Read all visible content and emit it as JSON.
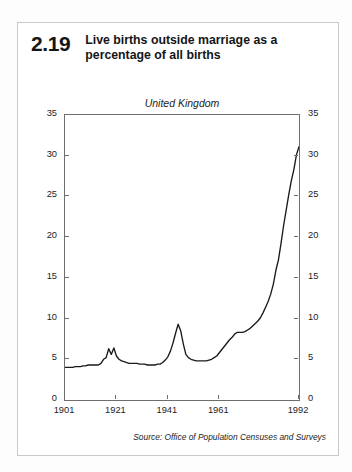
{
  "figure": {
    "number": "2.19",
    "title_line1": "Live births outside marriage as a",
    "title_line2": "percentage of all births",
    "source": "Source: Office of Population Censuses and Surveys"
  },
  "chart_data": {
    "type": "line",
    "title": "Live births outside marriage as a percentage of all births",
    "subtitle": "United Kingdom",
    "ylabel": "Percentages",
    "xlabel": "",
    "ylim": [
      0,
      35
    ],
    "xlim": [
      1901,
      1992
    ],
    "grid": false,
    "legend": "none",
    "yticks": [
      0,
      5,
      10,
      15,
      20,
      25,
      30,
      35
    ],
    "ytick_labels": [
      "0",
      "5",
      "10",
      "15",
      "20",
      "25",
      "30",
      "35"
    ],
    "ytick_labels_right": [
      "0",
      "5",
      "10",
      "15",
      "20",
      "25",
      "30",
      "35"
    ],
    "xticks": [
      1901,
      1921,
      1941,
      1961,
      1992
    ],
    "xtick_labels": [
      "1901",
      "1921",
      "1941",
      "1961",
      "1992"
    ],
    "axis_note_top": "United Kingdom",
    "axis_note_inner": "Percentages",
    "series": [
      {
        "name": "Live births outside marriage (% of all births)",
        "color": "#1a1a1a",
        "x": [
          1901,
          1902,
          1903,
          1904,
          1905,
          1906,
          1907,
          1908,
          1909,
          1910,
          1911,
          1912,
          1913,
          1914,
          1915,
          1916,
          1917,
          1918,
          1919,
          1920,
          1921,
          1922,
          1923,
          1924,
          1925,
          1926,
          1927,
          1928,
          1929,
          1930,
          1931,
          1932,
          1933,
          1934,
          1935,
          1936,
          1937,
          1938,
          1939,
          1940,
          1941,
          1942,
          1943,
          1944,
          1945,
          1946,
          1947,
          1948,
          1949,
          1950,
          1951,
          1952,
          1953,
          1954,
          1955,
          1956,
          1957,
          1958,
          1959,
          1960,
          1961,
          1962,
          1963,
          1964,
          1965,
          1966,
          1967,
          1968,
          1969,
          1970,
          1971,
          1972,
          1973,
          1974,
          1975,
          1976,
          1977,
          1978,
          1979,
          1980,
          1981,
          1982,
          1983,
          1984,
          1985,
          1986,
          1987,
          1988,
          1989,
          1990,
          1991,
          1992
        ],
        "values": [
          4.0,
          4.0,
          4.0,
          4.0,
          4.1,
          4.1,
          4.1,
          4.2,
          4.2,
          4.3,
          4.3,
          4.3,
          4.3,
          4.3,
          4.5,
          5.0,
          5.2,
          6.3,
          5.6,
          6.4,
          5.4,
          5.0,
          4.8,
          4.7,
          4.6,
          4.5,
          4.5,
          4.5,
          4.5,
          4.4,
          4.4,
          4.4,
          4.3,
          4.3,
          4.3,
          4.3,
          4.4,
          4.4,
          4.6,
          4.9,
          5.3,
          6.0,
          7.0,
          8.2,
          9.3,
          8.5,
          6.9,
          5.6,
          5.2,
          5.0,
          4.9,
          4.8,
          4.8,
          4.8,
          4.8,
          4.8,
          4.9,
          5.0,
          5.2,
          5.4,
          5.8,
          6.2,
          6.6,
          7.0,
          7.4,
          7.7,
          8.1,
          8.3,
          8.3,
          8.3,
          8.4,
          8.6,
          8.8,
          9.1,
          9.4,
          9.7,
          10.1,
          10.7,
          11.4,
          12.1,
          13.0,
          14.2,
          15.9,
          17.2,
          19.2,
          21.4,
          23.3,
          25.2,
          26.9,
          28.3,
          30.1,
          31.1
        ]
      }
    ],
    "annotations": [
      {
        "label": "WWI peak",
        "x": 1920,
        "y": 6.4
      },
      {
        "label": "WWII peak",
        "x": 1945,
        "y": 9.3
      },
      {
        "label": "1992 endpoint",
        "x": 1992,
        "y": 31.1
      }
    ]
  }
}
